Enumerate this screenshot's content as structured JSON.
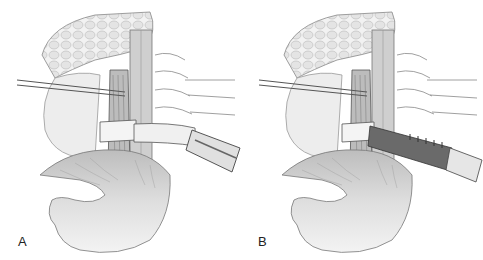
{
  "panels": [
    {
      "label": "A",
      "description": "Surgical illustration: esophagus encircled by Penrose drain, retracted to the right"
    },
    {
      "label": "B",
      "description": "Surgical illustration: esophagus encircled, dark tube/sleeve passed behind"
    }
  ]
}
